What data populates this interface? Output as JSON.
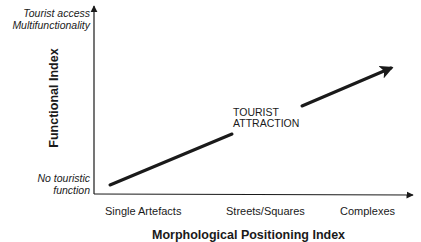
{
  "diagram": {
    "type": "conceptual-line-diagram",
    "y_axis": {
      "title": "Functional Index",
      "top_label_line1": "Tourist access",
      "top_label_line2": "Multifunctionality",
      "bottom_label_line1": "No touristic",
      "bottom_label_line2": "function"
    },
    "x_axis": {
      "title": "Morphological Positioning Index",
      "ticks": [
        "Single Artefacts",
        "Streets/Squares",
        "Complexes"
      ]
    },
    "annotation": {
      "line1": "TOURIST",
      "line2": "ATTRACTION"
    },
    "colors": {
      "line": "#1a1a1a",
      "background": "#ffffff"
    }
  }
}
